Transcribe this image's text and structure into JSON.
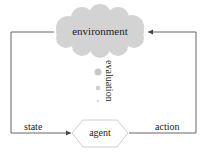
{
  "diagram": {
    "nodes": {
      "environment": {
        "label": "environment",
        "shape": "cloud",
        "fill": "#d3d3d3"
      },
      "agent": {
        "label": "agent",
        "shape": "hexagon",
        "fill": "#ffffff",
        "stroke": "#c8c8c8"
      }
    },
    "edges": {
      "state": {
        "label": "state",
        "from": "environment",
        "to": "agent"
      },
      "action": {
        "label": "action",
        "from": "agent",
        "to": "environment"
      }
    },
    "evaluation": {
      "label": "evaluation",
      "dots": [
        {
          "cx": 98,
          "cy": 72,
          "r": 3.5,
          "color": "#c8c8c8"
        },
        {
          "cx": 98,
          "cy": 88,
          "r": 2.3,
          "color": "#cfcfcf"
        },
        {
          "cx": 98,
          "cy": 101,
          "r": 1.2,
          "color": "#d6d6d6"
        }
      ]
    },
    "colors": {
      "line": "#555555",
      "cloud": "#d3d3d3",
      "hexagon_stroke": "#c8c8c8"
    }
  }
}
